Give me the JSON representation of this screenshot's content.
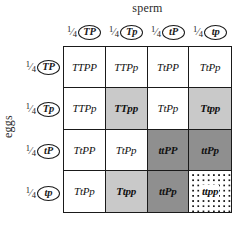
{
  "axes": {
    "top_label": "sperm",
    "left_label": "eggs"
  },
  "gametes": {
    "fraction_numerator": "1",
    "fraction_solidus": "⁄",
    "fraction_denominator": "4",
    "sperm": [
      "TP",
      "Tp",
      "tP",
      "tp"
    ],
    "eggs": [
      "TP",
      "Tp",
      "tP",
      "tp"
    ]
  },
  "legend": {
    "white": "tall purple (T_P_)",
    "light_gray": "tall white (T_pp)",
    "dark_gray": "dwarf purple (ttP_)",
    "dotted": "dwarf white (ttpp)"
  },
  "chart_data": {
    "type": "table",
    "xlabel": "sperm",
    "ylabel": "eggs",
    "categories": [
      "TP",
      "Tp",
      "tP",
      "tp"
    ],
    "row_categories": [
      "TP",
      "Tp",
      "tP",
      "tp"
    ],
    "grid": true,
    "legend_position": "none",
    "cells": [
      {
        "genotype": "TTPP",
        "shade": "sh-white"
      },
      {
        "genotype": "TTPp",
        "shade": "sh-white"
      },
      {
        "genotype": "TtPP",
        "shade": "sh-white"
      },
      {
        "genotype": "TtPp",
        "shade": "sh-white"
      },
      {
        "genotype": "TTPp",
        "shade": "sh-white"
      },
      {
        "genotype": "TTpp",
        "shade": "sh-light"
      },
      {
        "genotype": "TtPp",
        "shade": "sh-white"
      },
      {
        "genotype": "Ttpp",
        "shade": "sh-light"
      },
      {
        "genotype": "TtPP",
        "shade": "sh-white"
      },
      {
        "genotype": "TtPp",
        "shade": "sh-white"
      },
      {
        "genotype": "ttPP",
        "shade": "sh-dark"
      },
      {
        "genotype": "ttPp",
        "shade": "sh-dark"
      },
      {
        "genotype": "TtPp",
        "shade": "sh-white"
      },
      {
        "genotype": "Ttpp",
        "shade": "sh-light"
      },
      {
        "genotype": "ttPp",
        "shade": "sh-dark"
      },
      {
        "genotype": "ttpp",
        "shade": "sh-dotted"
      }
    ]
  },
  "colors": {
    "white": "#ffffff",
    "light_gray": "#c9c9c9",
    "dark_gray": "#8f8f8f",
    "ink": "#1a1a1a"
  }
}
